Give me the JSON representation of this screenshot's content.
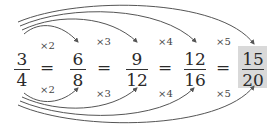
{
  "diagram": {
    "fractions": [
      {
        "num": "3",
        "den": "4"
      },
      {
        "num": "6",
        "den": "8"
      },
      {
        "num": "9",
        "den": "12"
      },
      {
        "num": "12",
        "den": "16"
      },
      {
        "num": "15",
        "den": "20"
      }
    ],
    "equals": "=",
    "multipliers_top": [
      "×2",
      "×3",
      "×4",
      "×5"
    ],
    "multipliers_bottom": [
      "×2",
      "×3",
      "×4",
      "×5"
    ],
    "highlight_color": "#d9d9d9",
    "arrow_color": "#555555"
  }
}
